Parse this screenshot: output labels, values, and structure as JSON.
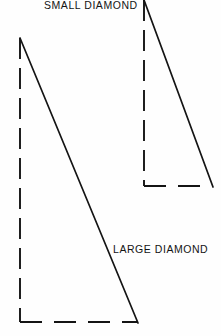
{
  "canvas": {
    "width": 221,
    "height": 336,
    "background_color": "#fefefe",
    "line_color": "#141414",
    "text_color": "#141414"
  },
  "diagram": {
    "title": "",
    "type": "line-drawing"
  },
  "labels": {
    "small_diamond": "SMALL DIAMOND",
    "large_diamond": "LARGE DIAMOND"
  },
  "shapes": [
    {
      "name": "small-diamond-triangle",
      "label": "SMALL DIAMOND",
      "apex": [
        144,
        0
      ],
      "bottom_left": [
        144,
        186
      ],
      "bottom_right": [
        212,
        186
      ],
      "solid_edge": "hypotenuse",
      "dashed_edges": [
        "vertical-left",
        "horizontal-bottom"
      ],
      "stroke_width": 1.9,
      "stroke_color": "#141414"
    },
    {
      "name": "large-diamond-triangle",
      "label": "LARGE DIAMOND",
      "apex": [
        20,
        38
      ],
      "bottom_left": [
        20,
        322
      ],
      "bottom_right": [
        137,
        322
      ],
      "solid_edge": "hypotenuse",
      "dashed_edges": [
        "vertical-left",
        "horizontal-bottom"
      ],
      "stroke_width": 1.9,
      "stroke_color": "#141414"
    }
  ],
  "dash_patterns": {
    "vertical": "21 9",
    "horizontal": "22 12"
  }
}
